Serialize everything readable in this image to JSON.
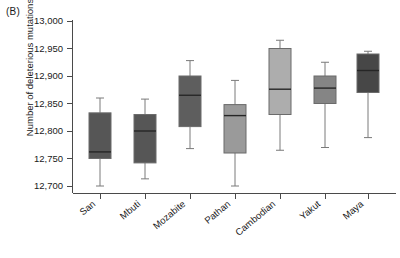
{
  "panel": {
    "label": "(B)"
  },
  "axes": {
    "ylabel": "Number of deleterious mutations",
    "xlabel": "",
    "yticks": [
      "12,700",
      "12,750",
      "12,800",
      "12,850",
      "12,900",
      "12,950",
      "13,000"
    ]
  },
  "chart_data": {
    "type": "box",
    "title": "(B)",
    "xlabel": "",
    "ylabel": "Number of deleterious mutations",
    "ylim": [
      12680,
      13000
    ],
    "ytick_values": [
      12700,
      12750,
      12800,
      12850,
      12900,
      12950,
      13000
    ],
    "grid": false,
    "legend": "none",
    "categories": [
      "San",
      "Mbuti",
      "Mozabite",
      "Pathan",
      "Cambodian",
      "Yakut",
      "Maya"
    ],
    "boxes": [
      {
        "name": "San",
        "whisker_low": 12700,
        "q1": 12750,
        "median": 12762,
        "q3": 12833,
        "whisker_high": 12860,
        "fill": "#565656"
      },
      {
        "name": "Mbuti",
        "whisker_low": 12713,
        "q1": 12742,
        "median": 12800,
        "q3": 12830,
        "whisker_high": 12858,
        "fill": "#565656"
      },
      {
        "name": "Mozabite",
        "whisker_low": 12768,
        "q1": 12808,
        "median": 12865,
        "q3": 12900,
        "whisker_high": 12928,
        "fill": "#5e5e5e"
      },
      {
        "name": "Pathan",
        "whisker_low": 12700,
        "q1": 12760,
        "median": 12828,
        "q3": 12848,
        "whisker_high": 12892,
        "fill": "#9a9a9a"
      },
      {
        "name": "Cambodian",
        "whisker_low": 12765,
        "q1": 12830,
        "median": 12876,
        "q3": 12950,
        "whisker_high": 12965,
        "fill": "#adadad"
      },
      {
        "name": "Yakut",
        "whisker_low": 12770,
        "q1": 12850,
        "median": 12878,
        "q3": 12900,
        "whisker_high": 12925,
        "fill": "#858585"
      },
      {
        "name": "Maya",
        "whisker_low": 12788,
        "q1": 12870,
        "median": 12910,
        "q3": 12940,
        "whisker_high": 12945,
        "fill": "#474747"
      }
    ]
  }
}
